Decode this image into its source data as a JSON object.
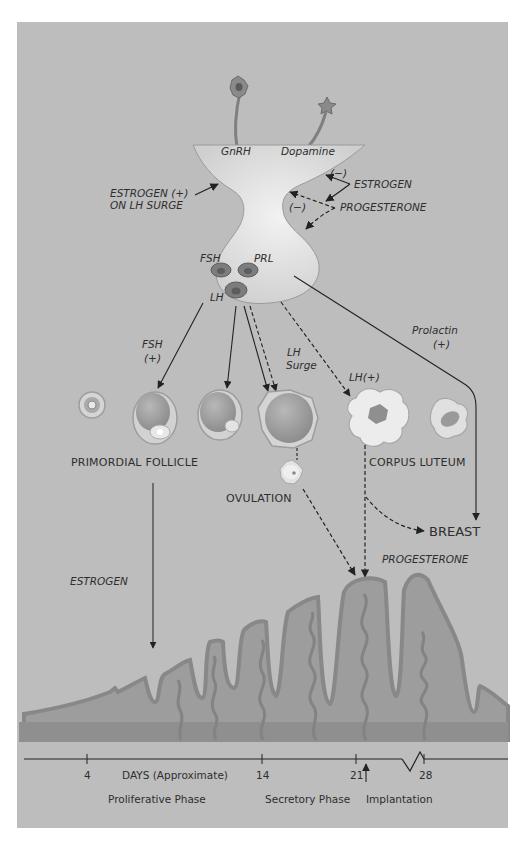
{
  "colors": {
    "background": "#bdbdbd",
    "page": "#ffffff",
    "gland": "#d9d9d9",
    "tissue": "#9d9d9d",
    "tissue_dark": "#8c8c8c",
    "tissue_edge": "#7a7a7a",
    "follicle": "#9a9a9a",
    "follicle_rim": "#d8d8d8",
    "ink": "#222222"
  },
  "hypothalamus": {
    "left_neuron_label": "GnRH",
    "right_neuron_label": "Dopamine",
    "estrogen_positive_line1": "ESTROGEN (+)",
    "estrogen_positive_line2": "ON LH SURGE",
    "estrogen_negative_sign": "(−)",
    "estrogen_label": "ESTROGEN",
    "progesterone_negative_sign": "(−)",
    "progesterone_label": "PROGESTERONE"
  },
  "pituitary": {
    "fsh_label": "FSH",
    "prl_label": "PRL",
    "lh_label": "LH"
  },
  "pathways": {
    "fsh_label": "FSH",
    "fsh_sign": "(+)",
    "lh_surge_line1": "LH",
    "lh_surge_line2": "Surge",
    "lh_plus": "LH(+)",
    "prolactin_label": "Prolactin",
    "prolactin_sign": "(+)"
  },
  "ovary": {
    "primordial_follicle": "PRIMORDIAL FOLLICLE",
    "ovulation": "OVULATION",
    "corpus_luteum": "CORPUS LUTEUM",
    "breast": "BREAST",
    "progesterone": "PROGESTERONE",
    "estrogen": "ESTROGEN"
  },
  "timeline": {
    "ticks": [
      {
        "label": "4",
        "x": 87
      },
      {
        "label": "14",
        "x": 262
      },
      {
        "label": "21",
        "x": 356
      },
      {
        "label": "28",
        "x": 424
      }
    ],
    "days_label": "DAYS (Approximate)",
    "proliferative_phase": "Proliferative Phase",
    "secretory_phase": "Secretory Phase",
    "implantation": "Implantation"
  }
}
